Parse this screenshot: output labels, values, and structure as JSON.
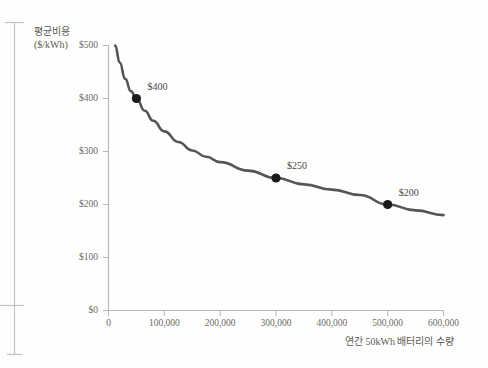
{
  "chart_data": {
    "type": "line",
    "title": "",
    "subtitle": "",
    "xlabel": "연간 50kWh 배터리의 수량",
    "ylabel": "평균비용 ($/kWh)",
    "ylabel_line1": "평균비용",
    "ylabel_line2": "($/kWh)",
    "xlim": [
      0,
      600000
    ],
    "ylim": [
      0,
      500
    ],
    "grid": false,
    "legend": "none",
    "xticks": [
      0,
      100000,
      200000,
      300000,
      400000,
      500000,
      600000
    ],
    "xtick_labels": [
      "0",
      "100,000",
      "200,000",
      "300,000",
      "400,000",
      "500,000",
      "600,000"
    ],
    "yticks": [
      0,
      100,
      200,
      300,
      400,
      500
    ],
    "ytick_labels": [
      "$0",
      "$100",
      "$200",
      "$300",
      "$400",
      "$500"
    ],
    "series": [
      {
        "name": "평균비용",
        "color": "#555555",
        "x": [
          12000,
          20000,
          30000,
          40000,
          50000,
          65000,
          80000,
          100000,
          125000,
          150000,
          175000,
          200000,
          250000,
          300000,
          350000,
          400000,
          450000,
          500000,
          550000,
          600000
        ],
        "values": [
          500,
          468,
          437,
          414,
          400,
          377,
          358,
          338,
          318,
          302,
          290,
          280,
          264,
          250,
          238,
          228,
          218,
          200,
          189,
          180
        ]
      }
    ],
    "annotated_points": [
      {
        "label": "$400",
        "x": 50000,
        "y": 400
      },
      {
        "label": "$250",
        "x": 300000,
        "y": 250
      },
      {
        "label": "$200",
        "x": 500000,
        "y": 200
      }
    ],
    "colors": {
      "curve": "#555555",
      "marker": "#1a1a1a",
      "axis": "#b9b9b9",
      "text": "#6d6a64",
      "background": "#fefefe"
    }
  },
  "decor": {
    "left_bracket_name": "margin-bracket"
  }
}
